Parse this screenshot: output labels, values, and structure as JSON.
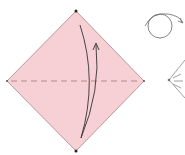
{
  "diagram": {
    "type": "origami-step",
    "paper": {
      "shape": "square-diamond",
      "fill": "#f6d0d4",
      "stroke": "#a98586",
      "vertices": {
        "top": [
          76,
          11
        ],
        "right": [
          144,
          81
        ],
        "bottom": [
          76,
          151
        ],
        "left": [
          7,
          81
        ]
      }
    },
    "fold_line": {
      "style": "valley-dashed",
      "color": "#b07a7e",
      "from": [
        10,
        81
      ],
      "to": [
        141,
        81
      ]
    },
    "fold_arrow": {
      "direction": "bottom-to-top",
      "color": "#333333"
    },
    "side_icons": [
      {
        "name": "turn-over-icon",
        "meaning": "turn over"
      },
      {
        "name": "repeat-fold-icon",
        "meaning": "fold result preview"
      }
    ]
  }
}
